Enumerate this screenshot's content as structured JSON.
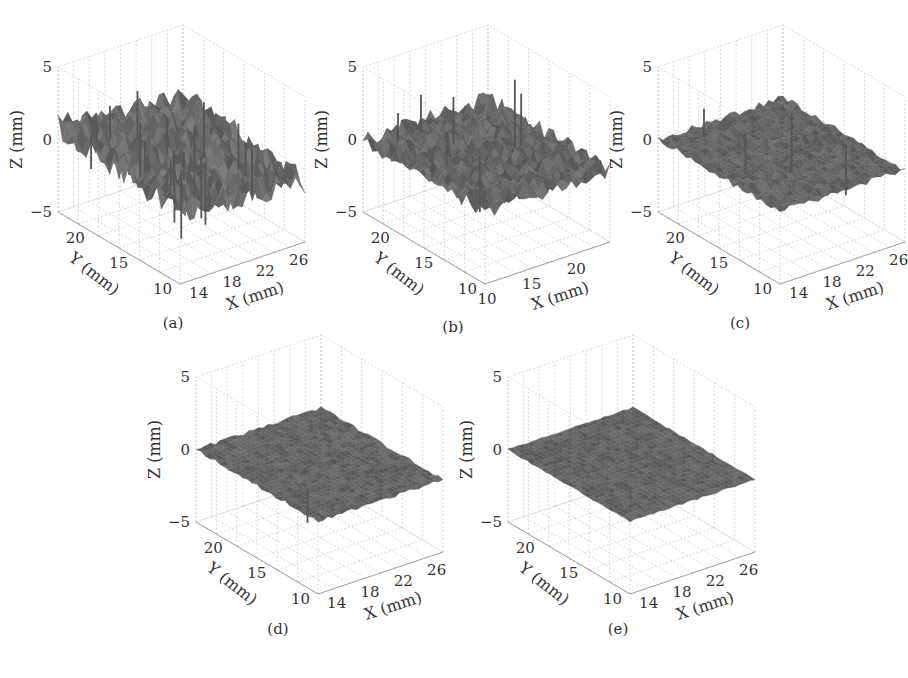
{
  "figure": {
    "panels": [
      {
        "id": "a",
        "caption": "(a)",
        "roughness": "high",
        "spikes": "many"
      },
      {
        "id": "b",
        "caption": "(b)",
        "roughness": "medium",
        "spikes": "some"
      },
      {
        "id": "c",
        "caption": "(c)",
        "roughness": "low",
        "spikes": "few"
      },
      {
        "id": "d",
        "caption": "(d)",
        "roughness": "very low",
        "spikes": "one"
      },
      {
        "id": "e",
        "caption": "(e)",
        "roughness": "minimal",
        "spikes": "none"
      }
    ]
  },
  "chart_data": [
    {
      "type": "surface3d",
      "title": "(a)",
      "xlabel": "X (mm)",
      "ylabel": "Y (mm)",
      "zlabel": "Z (mm)",
      "xticks": [
        "14",
        "18",
        "22",
        "26"
      ],
      "yticks": [
        "10",
        "15",
        "20"
      ],
      "zticks": [
        "5",
        "0",
        "-5"
      ],
      "xlim": [
        12,
        27
      ],
      "ylim": [
        10,
        24
      ],
      "zlim": [
        -5,
        5
      ],
      "surface_roughness_amplitude": 1.6,
      "spike_count": 18,
      "grid": true
    },
    {
      "type": "surface3d",
      "title": "(b)",
      "xlabel": "X (mm)",
      "ylabel": "Y (mm)",
      "zlabel": "Z (mm)",
      "xticks": [
        "10",
        "15",
        "20"
      ],
      "yticks": [
        "10",
        "15",
        "20"
      ],
      "zticks": [
        "5",
        "0",
        "-5"
      ],
      "xlim": [
        10,
        24
      ],
      "ylim": [
        10,
        24
      ],
      "zlim": [
        -5,
        5
      ],
      "surface_roughness_amplitude": 0.9,
      "spike_count": 8,
      "grid": true
    },
    {
      "type": "surface3d",
      "title": "(c)",
      "xlabel": "X (mm)",
      "ylabel": "Y (mm)",
      "zlabel": "Z (mm)",
      "xticks": [
        "14",
        "18",
        "22",
        "26"
      ],
      "yticks": [
        "10",
        "15",
        "20"
      ],
      "zticks": [
        "5",
        "0",
        "-5"
      ],
      "xlim": [
        12,
        27
      ],
      "ylim": [
        10,
        24
      ],
      "zlim": [
        -5,
        5
      ],
      "surface_roughness_amplitude": 0.35,
      "spike_count": 4,
      "grid": true
    },
    {
      "type": "surface3d",
      "title": "(d)",
      "xlabel": "X (mm)",
      "ylabel": "Y (mm)",
      "zlabel": "Z (mm)",
      "xticks": [
        "14",
        "18",
        "22",
        "26"
      ],
      "yticks": [
        "10",
        "15",
        "20"
      ],
      "zticks": [
        "5",
        "0",
        "-5"
      ],
      "xlim": [
        12,
        27
      ],
      "ylim": [
        10,
        24
      ],
      "zlim": [
        -5,
        5
      ],
      "surface_roughness_amplitude": 0.2,
      "spike_count": 1,
      "grid": true
    },
    {
      "type": "surface3d",
      "title": "(e)",
      "xlabel": "X (mm)",
      "ylabel": "Y (mm)",
      "zlabel": "Z (mm)",
      "xticks": [
        "14",
        "18",
        "22",
        "26"
      ],
      "yticks": [
        "10",
        "15",
        "20"
      ],
      "zticks": [
        "5",
        "0",
        "-5"
      ],
      "xlim": [
        12,
        27
      ],
      "ylim": [
        10,
        24
      ],
      "zlim": [
        -5,
        5
      ],
      "surface_roughness_amplitude": 0.1,
      "spike_count": 0,
      "grid": true
    }
  ],
  "layout": {
    "panel_positions": [
      {
        "left": 30,
        "top": 62
      },
      {
        "left": 335,
        "top": 62
      },
      {
        "left": 630,
        "top": 62
      },
      {
        "left": 168,
        "top": 372
      },
      {
        "left": 480,
        "top": 372
      }
    ],
    "colors": {
      "surface_dark": "#3f3f3f",
      "surface_light": "#8a8a8a",
      "grid": "#c8c8c8",
      "axis": "#999999",
      "text": "#333333"
    }
  }
}
